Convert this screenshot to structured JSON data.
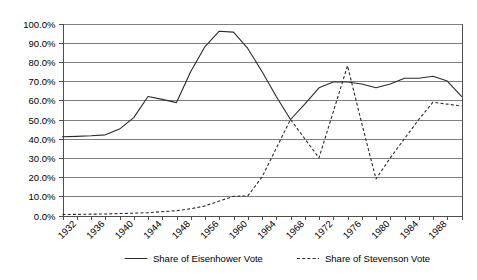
{
  "chart_data": {
    "type": "line",
    "title": "",
    "xlabel": "",
    "ylabel": "",
    "ylim": [
      0,
      100
    ],
    "ytick_labels": [
      "0.0%",
      "10.0%",
      "20.0%",
      "30.0%",
      "40.0%",
      "50.0%",
      "60.0%",
      "70.0%",
      "80.0%",
      "90.0%",
      "100.0%"
    ],
    "ytick_values": [
      0,
      10,
      20,
      30,
      40,
      50,
      60,
      70,
      80,
      90,
      100
    ],
    "grid": true,
    "legend_position": "bottom",
    "xtick_labels": [
      "1932",
      "1936",
      "1940",
      "1944",
      "1948",
      "1956",
      "1960",
      "1964",
      "1968",
      "1972",
      "1976",
      "1980",
      "1984",
      "1988"
    ],
    "x": [
      1932,
      1934,
      1936,
      1938,
      1940,
      1942,
      1944,
      1946,
      1948,
      1950,
      1952,
      1954,
      1956,
      1958,
      1960,
      1962,
      1964,
      1966,
      1968,
      1970,
      1972,
      1974,
      1976,
      1978,
      1980,
      1982,
      1984,
      1986,
      1988
    ],
    "series": [
      {
        "name": "Share of Eisenhower Vote",
        "style": "solid",
        "values": [
          41.0,
          41.2,
          41.5,
          42.0,
          45.0,
          51.0,
          62.0,
          60.5,
          58.8,
          75.0,
          88.0,
          96.0,
          95.5,
          87.0,
          75.0,
          62.0,
          50.0,
          58.0,
          66.5,
          69.5,
          69.5,
          68.5,
          66.5,
          68.5,
          71.5,
          71.5,
          72.5,
          70.0,
          62.0
        ]
      },
      {
        "name": "Share of Stevenson Vote",
        "style": "dashed",
        "values": [
          0.5,
          0.6,
          0.7,
          0.8,
          1.0,
          1.2,
          1.5,
          2.0,
          2.5,
          3.5,
          5.0,
          7.5,
          10.0,
          10.2,
          20.0,
          35.0,
          50.0,
          40.0,
          30.0,
          54.0,
          78.0,
          48.0,
          19.0,
          30.0,
          40.0,
          50.0,
          59.0,
          58.0,
          57.0
        ]
      }
    ],
    "legend": [
      {
        "label": "Share of Eisenhower Vote",
        "style": "solid"
      },
      {
        "label": "Share of Stevenson Vote",
        "style": "dashed"
      }
    ]
  }
}
